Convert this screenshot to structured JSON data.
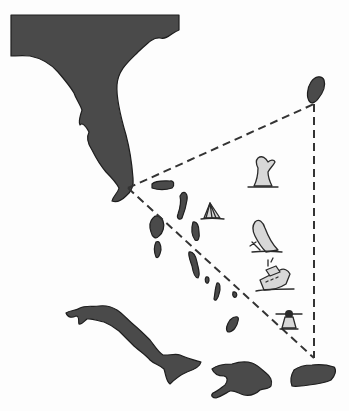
{
  "map": {
    "subject": "Bermuda Triangle",
    "colors": {
      "land": "#4a4a4a",
      "land_outline": "#1e1e1e",
      "route": "#333333",
      "icon_fill": "#d8d8d8",
      "background": "#fdfdfd"
    },
    "regions": [
      {
        "name": "florida",
        "label": ""
      },
      {
        "name": "bermuda",
        "label": ""
      },
      {
        "name": "bahamas",
        "label": ""
      },
      {
        "name": "cuba",
        "label": ""
      },
      {
        "name": "hispaniola",
        "label": ""
      },
      {
        "name": "puerto-rico",
        "label": ""
      }
    ],
    "triangle_vertices": [
      {
        "name": "miami",
        "x": 128,
        "y": 188
      },
      {
        "name": "bermuda",
        "x": 314,
        "y": 104
      },
      {
        "name": "puerto-rico",
        "x": 314,
        "y": 358
      }
    ],
    "icons": [
      {
        "name": "sinking-ship-bow-icon",
        "x": 262,
        "y": 170
      },
      {
        "name": "sailboat-icon",
        "x": 212,
        "y": 210
      },
      {
        "name": "sinking-plane-icon",
        "x": 262,
        "y": 235
      },
      {
        "name": "sinking-ship-icon",
        "x": 272,
        "y": 275
      },
      {
        "name": "airplane-icon",
        "x": 290,
        "y": 320
      }
    ]
  }
}
